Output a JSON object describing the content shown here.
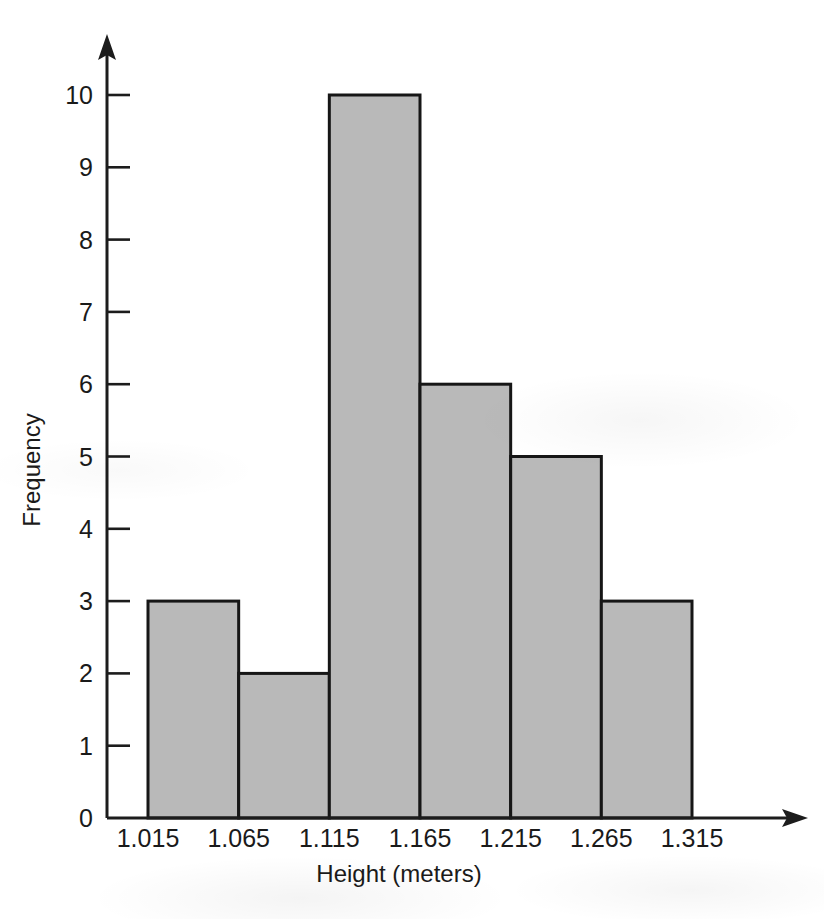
{
  "chart_data": {
    "type": "bar",
    "title": "",
    "subtitle": "",
    "xlabel": "Height (meters)",
    "ylabel": "Frequency",
    "categories": [
      "1.015-1.065",
      "1.065-1.115",
      "1.115-1.165",
      "1.165-1.215",
      "1.215-1.265",
      "1.265-1.315"
    ],
    "bin_edges": [
      1.015,
      1.065,
      1.115,
      1.165,
      1.215,
      1.265,
      1.315
    ],
    "values": [
      3,
      2,
      10,
      6,
      5,
      3
    ],
    "bin_width": 0.05,
    "xtick_labels": [
      "1.015",
      "1.065",
      "1.115",
      "1.165",
      "1.215",
      "1.265",
      "1.315"
    ],
    "ytick_labels": [
      "0",
      "1",
      "2",
      "3",
      "4",
      "5",
      "6",
      "7",
      "8",
      "9",
      "10"
    ],
    "ytick_values": [
      0,
      1,
      2,
      3,
      4,
      5,
      6,
      7,
      8,
      9,
      10
    ],
    "ylim": [
      0,
      10
    ],
    "xlim": [
      1.015,
      1.315
    ],
    "grid": false,
    "legend": false,
    "legend_position": "none",
    "bar_fill_color": "#b9b9b9",
    "bar_edge_color": "#161616",
    "axis_color": "#1c1c1c",
    "x_axis_arrow": true,
    "y_axis_arrow": true,
    "tick_direction": "in",
    "total_frequency": 29
  }
}
